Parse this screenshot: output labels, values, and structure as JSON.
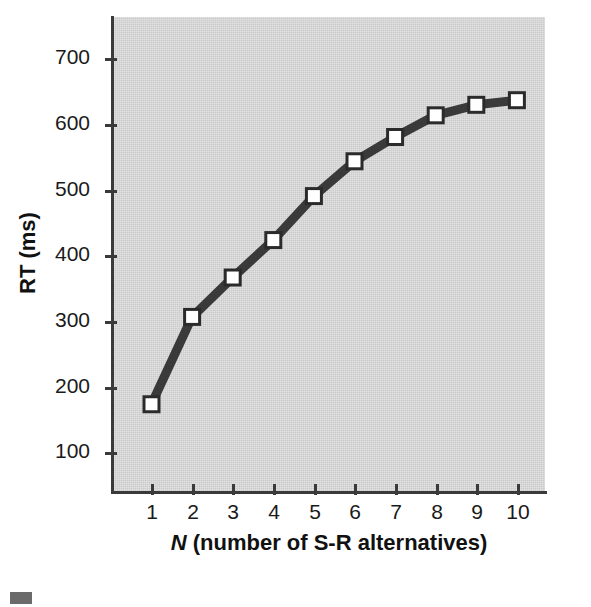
{
  "chart_data": {
    "type": "line",
    "title": "",
    "subtitle": "",
    "xlabel_prefix": "N",
    "xlabel_rest": " (number of S-R alternatives)",
    "xlabel": "N (number of S-R alternatives)",
    "ylabel": "RT (ms)",
    "x": [
      1,
      2,
      3,
      4,
      5,
      6,
      7,
      8,
      9,
      10
    ],
    "categories": [
      "1",
      "2",
      "3",
      "4",
      "5",
      "6",
      "7",
      "8",
      "9",
      "10"
    ],
    "values": [
      175,
      308,
      368,
      425,
      492,
      545,
      582,
      615,
      631,
      638
    ],
    "series": [
      {
        "name": "RT",
        "values": [
          175,
          308,
          368,
          425,
          492,
          545,
          582,
          615,
          631,
          638
        ]
      }
    ],
    "xlim": [
      0.3,
      10.7
    ],
    "ylim": [
      40,
      760
    ],
    "xticks": [
      1,
      2,
      3,
      4,
      5,
      6,
      7,
      8,
      9,
      10
    ],
    "xtick_labels": [
      "1",
      "2",
      "3",
      "4",
      "5",
      "6",
      "7",
      "8",
      "9",
      "10"
    ],
    "yticks": [
      100,
      200,
      300,
      400,
      500,
      600,
      700
    ],
    "ytick_labels": [
      "100",
      "200",
      "300",
      "400",
      "500",
      "600",
      "700"
    ],
    "grid": false,
    "legend": false,
    "legend_position": "none",
    "colors": {
      "line": "#3a3a3a",
      "marker_face": "#ffffff",
      "marker_edge": "#2b2b2b",
      "plot_background": "#e2e2e2",
      "axis": "#3a3a3a",
      "text": "#111111"
    },
    "marker": "square",
    "annotations": []
  }
}
